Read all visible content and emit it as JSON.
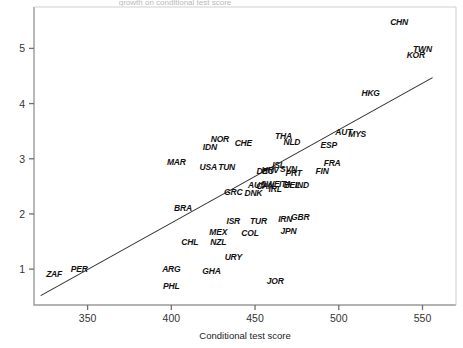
{
  "chart_data": {
    "type": "scatter",
    "title": "",
    "xlabel": "Conditional test score",
    "ylabel": "",
    "xlim": [
      318,
      570
    ],
    "ylim": [
      0.35,
      5.75
    ],
    "xticks": [
      350,
      400,
      450,
      500,
      550
    ],
    "yticks": [
      1,
      2,
      3,
      4,
      5
    ],
    "grid": false,
    "legend": null,
    "marker_style": "text-label-only",
    "trend_line": {
      "type": "linear-fit",
      "x_start": 322,
      "y_start": 0.52,
      "x_end": 556,
      "y_end": 4.47
    },
    "points": [
      {
        "label": "ZAF",
        "x": 330,
        "y": 0.92
      },
      {
        "label": "PER",
        "x": 345,
        "y": 1.0
      },
      {
        "label": "ARG",
        "x": 400,
        "y": 1.0
      },
      {
        "label": "PHL",
        "x": 400,
        "y": 0.7
      },
      {
        "label": "GHA",
        "x": 424,
        "y": 0.97
      },
      {
        "label": "JOR",
        "x": 462,
        "y": 0.78
      },
      {
        "label": "URY",
        "x": 437,
        "y": 1.22
      },
      {
        "label": "CHL",
        "x": 411,
        "y": 1.5
      },
      {
        "label": "NZL",
        "x": 428,
        "y": 1.5
      },
      {
        "label": "MEX",
        "x": 428,
        "y": 1.67
      },
      {
        "label": "COL",
        "x": 447,
        "y": 1.66
      },
      {
        "label": "ISR",
        "x": 437,
        "y": 1.88
      },
      {
        "label": "BRA",
        "x": 407,
        "y": 2.1
      },
      {
        "label": "TUR",
        "x": 452,
        "y": 1.88
      },
      {
        "label": "IRN",
        "x": 468,
        "y": 1.9
      },
      {
        "label": "GBR",
        "x": 477,
        "y": 1.95
      },
      {
        "label": "JPN",
        "x": 470,
        "y": 1.7
      },
      {
        "label": "GRC",
        "x": 437,
        "y": 2.4
      },
      {
        "label": "DNK",
        "x": 449,
        "y": 2.38
      },
      {
        "label": "AUS",
        "x": 451,
        "y": 2.52
      },
      {
        "label": "CAN",
        "x": 456,
        "y": 2.5
      },
      {
        "label": "SWE",
        "x": 459,
        "y": 2.55
      },
      {
        "label": "IRL",
        "x": 462,
        "y": 2.45
      },
      {
        "label": "ITA",
        "x": 468,
        "y": 2.55
      },
      {
        "label": "BEL",
        "x": 472,
        "y": 2.52
      },
      {
        "label": "IND",
        "x": 478,
        "y": 2.52
      },
      {
        "label": "USA",
        "x": 422,
        "y": 2.85
      },
      {
        "label": "TUN",
        "x": 433,
        "y": 2.85
      },
      {
        "label": "MAR",
        "x": 403,
        "y": 2.95
      },
      {
        "label": "DEU",
        "x": 456,
        "y": 2.78
      },
      {
        "label": "HRV",
        "x": 459,
        "y": 2.8
      },
      {
        "label": "ISL",
        "x": 464,
        "y": 2.88
      },
      {
        "label": "SVN",
        "x": 470,
        "y": 2.82
      },
      {
        "label": "PRT",
        "x": 473,
        "y": 2.75
      },
      {
        "label": "FIN",
        "x": 490,
        "y": 2.78
      },
      {
        "label": "FRA",
        "x": 496,
        "y": 2.92
      },
      {
        "label": "IDN",
        "x": 423,
        "y": 3.22
      },
      {
        "label": "NOR",
        "x": 429,
        "y": 3.35
      },
      {
        "label": "CHE",
        "x": 443,
        "y": 3.28
      },
      {
        "label": "NLD",
        "x": 472,
        "y": 3.3
      },
      {
        "label": "THA",
        "x": 467,
        "y": 3.42
      },
      {
        "label": "ESP",
        "x": 494,
        "y": 3.25
      },
      {
        "label": "AUT",
        "x": 503,
        "y": 3.48
      },
      {
        "label": "MYS",
        "x": 511,
        "y": 3.45
      },
      {
        "label": "HKG",
        "x": 519,
        "y": 4.2
      },
      {
        "label": "KOR",
        "x": 546,
        "y": 4.88
      },
      {
        "label": "TWN",
        "x": 550,
        "y": 4.98
      },
      {
        "label": "CHN",
        "x": 536,
        "y": 5.48
      }
    ]
  },
  "axes": {
    "x_title": "Conditional test score",
    "x_tick_labels": [
      "350",
      "400",
      "450",
      "500",
      "550"
    ],
    "y_tick_labels": [
      "1",
      "2",
      "3",
      "4",
      "5"
    ]
  },
  "artifacts": {
    "top_clipped_text": "growth on conditional test score"
  },
  "colors": {
    "axis": "#808080",
    "text": "#111111",
    "line": "#333333",
    "background": "#ffffff"
  }
}
